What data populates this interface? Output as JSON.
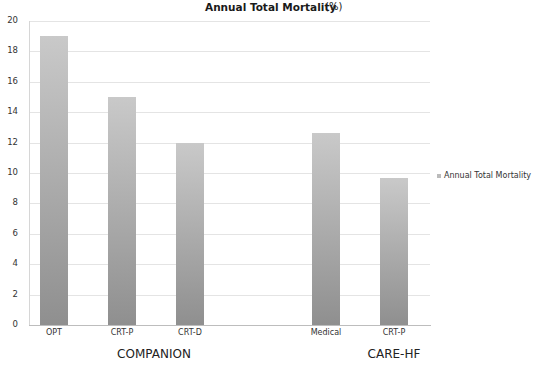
{
  "chart_data": {
    "type": "bar",
    "title": "Annual Total Mortality",
    "title_unit": "(%)",
    "xlabel": "",
    "ylabel": "",
    "ylim": [
      0,
      20
    ],
    "yticks": [
      0,
      2,
      4,
      6,
      8,
      10,
      12,
      14,
      16,
      18,
      20
    ],
    "grid": true,
    "legend_position": "right",
    "categories": [
      "OPT",
      "CRT-P",
      "CRT-D",
      "",
      "Medical",
      "CRT-P"
    ],
    "groups": [
      {
        "label": "COMPANION",
        "categories": [
          "OPT",
          "CRT-P",
          "CRT-D"
        ]
      },
      {
        "label": "CARE-HF",
        "categories": [
          "Medical",
          "CRT-P"
        ]
      }
    ],
    "series": [
      {
        "name": "Annual Total Mortality",
        "values": [
          19.0,
          15.0,
          12.0,
          null,
          12.6,
          9.7
        ]
      }
    ]
  },
  "title": {
    "main": "Annual Total Mortality",
    "unit": "(%)"
  },
  "yaxis": {
    "ticks": [
      "0",
      "2",
      "4",
      "6",
      "8",
      "10",
      "12",
      "14",
      "16",
      "18",
      "20"
    ]
  },
  "xaxis": {
    "labels": [
      "OPT",
      "CRT-P",
      "CRT-D",
      "Medical",
      "CRT-P"
    ]
  },
  "groups": {
    "companion": "COMPANION",
    "carehf": "CARE-HF"
  },
  "legend": {
    "label": "Annual Total Mortality",
    "color": "#bbbbbb"
  }
}
